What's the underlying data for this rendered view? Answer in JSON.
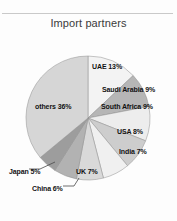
{
  "chart_data": {
    "type": "pie",
    "title": "Import partners",
    "xlabel": "",
    "ylabel": "",
    "legend_position": "none",
    "grid": false,
    "unit": "%",
    "start_angle_deg": 0,
    "direction": "clockwise",
    "categories": [
      "UAE",
      "Saudi Arabia",
      "South Africa",
      "USA",
      "India",
      "UK",
      "China",
      "Japan",
      "others"
    ],
    "values": [
      13,
      9,
      9,
      8,
      7,
      7,
      6,
      5,
      36
    ],
    "labels": [
      "UAE 13%",
      "Saudi Arabia 9%",
      "South Africa 9%",
      "USA 8%",
      "India 7%",
      "UK 7%",
      "China 6%",
      "Japan 5%",
      "others 36%"
    ],
    "colors": [
      "#f3f3f3",
      "#b6b6b6",
      "#ededed",
      "#cdcdcd",
      "#f0f0f0",
      "#d9d9d9",
      "#b2b2b2",
      "#9d9d9d",
      "#d6d6d6"
    ],
    "slice_outline_color": "#8f8f8f",
    "leader_line_color": "#4a4a4a"
  },
  "slices": [
    {
      "name": "UAE",
      "label": "UAE 13%",
      "value": 13,
      "color": "#f3f3f3"
    },
    {
      "name": "Saudi Arabia",
      "label": "Saudi Arabia 9%",
      "value": 9,
      "color": "#b6b6b6"
    },
    {
      "name": "South Africa",
      "label": "South Africa 9%",
      "value": 9,
      "color": "#ededed"
    },
    {
      "name": "USA",
      "label": "USA 8%",
      "value": 8,
      "color": "#cdcdcd"
    },
    {
      "name": "India",
      "label": "India 7%",
      "value": 7,
      "color": "#f0f0f0"
    },
    {
      "name": "UK",
      "label": "UK 7%",
      "value": 7,
      "color": "#d9d9d9"
    },
    {
      "name": "China",
      "label": "China 6%",
      "value": 6,
      "color": "#b2b2b2"
    },
    {
      "name": "Japan",
      "label": "Japan 5%",
      "value": 5,
      "color": "#9d9d9d"
    },
    {
      "name": "others",
      "label": "others 36%",
      "value": 36,
      "color": "#d6d6d6"
    }
  ]
}
